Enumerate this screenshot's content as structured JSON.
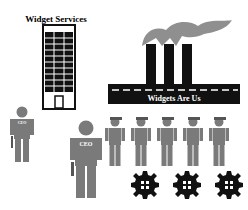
{
  "diagram": {
    "title": "",
    "entities": {
      "service_company": {
        "label": "Widget Services",
        "type": "office-building"
      },
      "factory": {
        "label": "Widgets Are Us",
        "type": "factory",
        "smokestacks": 3
      },
      "small_executive": {
        "label": "CEO",
        "label_note": "Label illegible at source resolution; shown as CEO to match the larger figure, not confirmed",
        "type": "person-with-briefcase"
      },
      "large_executive": {
        "label": "CEO",
        "type": "person-with-briefcase"
      },
      "workers": {
        "count": 5,
        "type": "person-with-cap"
      },
      "gears": {
        "count": 3,
        "type": "gear"
      }
    },
    "colors": {
      "figure_gray": "#7a7a7a",
      "smoke_gray": "#8f8f8f",
      "structure_black": "#111111",
      "background": "#ffffff"
    }
  }
}
